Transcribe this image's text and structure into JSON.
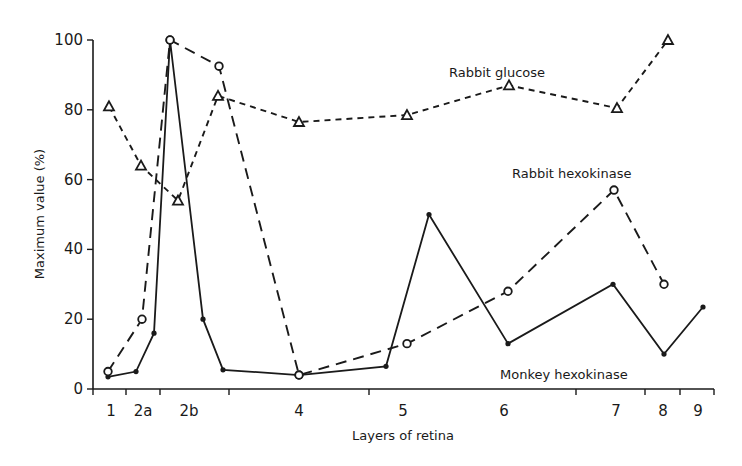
{
  "chart_data": {
    "type": "line",
    "title": "",
    "xlabel": "Layers of retina",
    "ylabel": "Maximum value (%)",
    "ylim": [
      0,
      100
    ],
    "yticks": [
      0,
      20,
      40,
      60,
      80,
      100
    ],
    "grid": false,
    "legend": "inline labels next to series",
    "x_categories": [
      {
        "label": "1",
        "from": 0.0,
        "to": 1.0
      },
      {
        "label": "2a",
        "from": 1.0,
        "to": 2.0
      },
      {
        "label": "2b",
        "from": 2.0,
        "to": 4.0
      },
      {
        "label": "4",
        "from": 4.0,
        "to": 8.0
      },
      {
        "label": "5",
        "from": 8.0,
        "to": 14.0
      },
      {
        "label": "6",
        "from": 14.0,
        "to": 16.0
      },
      {
        "label": "7",
        "from": 16.0,
        "to": 17.0
      },
      {
        "label": "8",
        "from": 17.0,
        "to": 18.0
      },
      {
        "label": "9",
        "from": 18.0,
        "to": 19.0
      }
    ],
    "x_axis_note": "x positions expressed in pixel-derived units along the retina depth axis; tick marks at layer boundaries",
    "series": [
      {
        "name": "Monkey hexokinase",
        "style": "solid",
        "marker": "filled-circle",
        "points": [
          {
            "px": 108,
            "y": 3.5
          },
          {
            "px": 136,
            "y": 5
          },
          {
            "px": 154,
            "y": 16
          },
          {
            "px": 170,
            "y": 100
          },
          {
            "px": 203,
            "y": 20
          },
          {
            "px": 223,
            "y": 5.5
          },
          {
            "px": 299,
            "y": 4
          },
          {
            "px": 386,
            "y": 6.5
          },
          {
            "px": 429,
            "y": 50
          },
          {
            "px": 508,
            "y": 13
          },
          {
            "px": 613,
            "y": 30
          },
          {
            "px": 664,
            "y": 10
          },
          {
            "px": 703,
            "y": 23.5
          }
        ]
      },
      {
        "name": "Rabbit hexokinase",
        "style": "long-dash",
        "marker": "open-circle",
        "points": [
          {
            "px": 108,
            "y": 5
          },
          {
            "px": 142,
            "y": 20
          },
          {
            "px": 170,
            "y": 100
          },
          {
            "px": 219,
            "y": 92.5
          },
          {
            "px": 299,
            "y": 4
          },
          {
            "px": 407,
            "y": 13
          },
          {
            "px": 508,
            "y": 28
          },
          {
            "px": 614,
            "y": 57
          },
          {
            "px": 664,
            "y": 30
          }
        ]
      },
      {
        "name": "Rabbit glucose",
        "style": "short-dash",
        "marker": "open-triangle",
        "points": [
          {
            "px": 109,
            "y": 81
          },
          {
            "px": 141,
            "y": 64
          },
          {
            "px": 178,
            "y": 54
          },
          {
            "px": 218,
            "y": 84
          },
          {
            "px": 299,
            "y": 76.5
          },
          {
            "px": 407,
            "y": 78.5
          },
          {
            "px": 509,
            "y": 87
          },
          {
            "px": 617,
            "y": 80.5
          },
          {
            "px": 668,
            "y": 100
          }
        ]
      }
    ],
    "annotations": [
      {
        "text": "Rabbit glucose",
        "near_series": "Rabbit glucose"
      },
      {
        "text": "Rabbit hexokinase",
        "near_series": "Rabbit hexokinase"
      },
      {
        "text": "Monkey hexokinase",
        "near_series": "Monkey hexokinase"
      }
    ]
  },
  "labels": {
    "xlabel": "Layers of retina",
    "ylabel": "Maximum value (%)",
    "rabbit_glucose": "Rabbit glucose",
    "rabbit_hexokinase": "Rabbit hexokinase",
    "monkey_hexokinase": "Monkey hexokinase"
  },
  "layout": {
    "x_axis_left": 93,
    "x_axis_right": 714,
    "y_axis_top_px": 40,
    "y_axis_zero_px": 389,
    "x_boundary_ticks_px": [
      93,
      126,
      160,
      229,
      369,
      576,
      645,
      680,
      714
    ],
    "x_label_positions_px": [
      {
        "label": "1",
        "px": 111
      },
      {
        "label": "2a",
        "px": 143
      },
      {
        "label": "2b",
        "px": 189
      },
      {
        "label": "4",
        "px": 299
      },
      {
        "label": "5",
        "px": 403
      },
      {
        "label": "6",
        "px": 504
      },
      {
        "label": "7",
        "px": 616
      },
      {
        "label": "8",
        "px": 663
      },
      {
        "label": "9",
        "px": 698
      }
    ]
  }
}
